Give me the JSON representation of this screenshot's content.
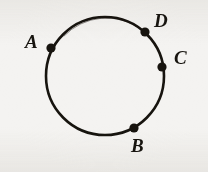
{
  "figure": {
    "kind": "geometry-diagram",
    "background_color": "#f4f3f1",
    "ink_color": "#17140f",
    "canvas": {
      "width": 208,
      "height": 172
    },
    "circle": {
      "name": "circle",
      "center_x": 105,
      "center_y": 76,
      "radius": 59,
      "stroke_width": 2.6,
      "stroke_color": "#17140f",
      "fill": "none"
    },
    "points": [
      {
        "id": "A",
        "label": "A",
        "dot_x": 51,
        "dot_y": 48,
        "dot_radius": 4.6,
        "label_x": 25,
        "label_y": 32,
        "angle_deg": 152
      },
      {
        "id": "D",
        "label": "D",
        "dot_x": 145,
        "dot_y": 32,
        "dot_radius": 4.6,
        "label_x": 154,
        "label_y": 11,
        "angle_deg": 48
      },
      {
        "id": "C",
        "label": "C",
        "dot_x": 162,
        "dot_y": 67,
        "dot_radius": 4.6,
        "label_x": 174,
        "label_y": 48,
        "angle_deg": 9
      },
      {
        "id": "B",
        "label": "B",
        "dot_x": 134,
        "dot_y": 128,
        "dot_radius": 4.6,
        "label_x": 131,
        "label_y": 136,
        "angle_deg": -61
      }
    ]
  }
}
